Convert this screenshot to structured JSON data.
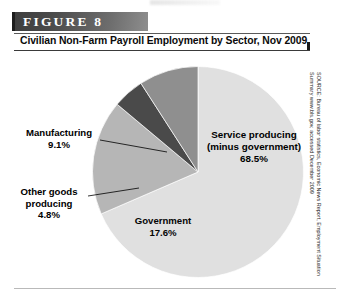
{
  "figure": {
    "banner_label": "FIGURE  8",
    "caption": "Civilian Non-Farm Payroll Employment by Sector, Nov 2009"
  },
  "source": {
    "text": "SOURCE: Bureau of labor statistics, Economic News Report, Employment Situation Summary www.bls.gov, accessed December 2009"
  },
  "labels": {
    "manufacturing": {
      "name": "Manufacturing",
      "value": "9.1%"
    },
    "other_goods": {
      "name": "Other goods",
      "name2": "producing",
      "value": "4.8%"
    },
    "government": {
      "name": "Government",
      "value": "17.6%"
    },
    "service": {
      "name": "Service producing",
      "name2": "(minus government)",
      "value": "68.5%"
    }
  },
  "chart_data": {
    "type": "pie",
    "title": "Civilian Non-Farm Payroll Employment by Sector, Nov 2009",
    "categories": [
      "Service producing (minus government)",
      "Government",
      "Other goods producing",
      "Manufacturing"
    ],
    "values": [
      68.5,
      17.6,
      4.8,
      9.1
    ],
    "unit": "percent",
    "colors": [
      "#e0e0e0",
      "#b6b6b6",
      "#4a4a4a",
      "#8f8f8f"
    ],
    "legend": "none",
    "labels_inline": true,
    "start_angle_deg": 0,
    "direction": "clockwise",
    "annotations": [
      "Service producing (minus government) 68.5%",
      "Government 17.6%",
      "Other goods producing 4.8%",
      "Manufacturing 9.1%"
    ]
  },
  "colors": {
    "service": "#e0e0e0",
    "government": "#b6b6b6",
    "other_goods": "#4a4a4a",
    "manufacturing": "#8f8f8f",
    "banner_dark": "#3d3d3d",
    "banner_light": "#8e8e8e"
  }
}
